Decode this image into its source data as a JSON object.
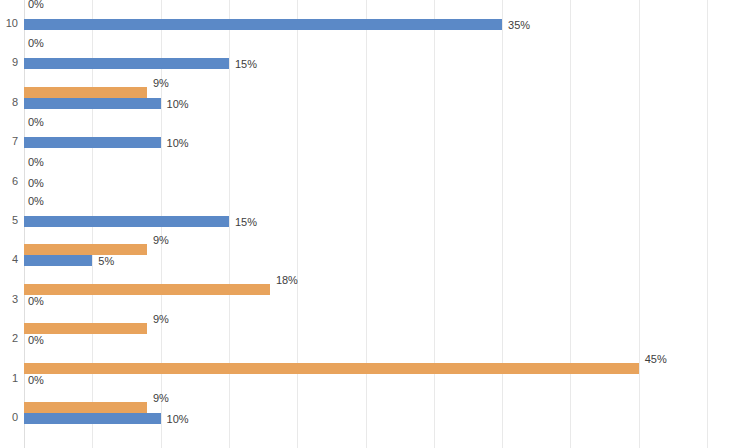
{
  "chart_data": {
    "type": "bar",
    "orientation": "horizontal",
    "title": "",
    "subtitle": "",
    "xlabel": "",
    "ylabel": "",
    "grid": true,
    "gridline_values": [
      0,
      5,
      10,
      15,
      20,
      25,
      30,
      35,
      40,
      45,
      50
    ],
    "xlim": [
      0,
      50
    ],
    "xtick_labels_visible": false,
    "categories": [
      "10",
      "9",
      "8",
      "7",
      "6",
      "5",
      "4",
      "3",
      "2",
      "1",
      "0"
    ],
    "category_order": "descending",
    "value_label_suffix": "%",
    "legend": {
      "position": "right",
      "clipped_by_image_edge": true,
      "entries": [
        {
          "name": "O",
          "color": "#e8a35c"
        },
        {
          "name": "A",
          "color": "#5b89c7"
        }
      ]
    },
    "series": [
      {
        "name": "O",
        "color": "#e8a35c",
        "values": [
          0,
          0,
          9,
          0,
          0,
          0,
          9,
          18,
          9,
          45,
          9
        ],
        "value_labels": [
          "0%",
          "0%",
          "9%",
          "0%",
          "0%",
          "0%",
          "9%",
          "18%",
          "9%",
          "45%",
          "9%"
        ]
      },
      {
        "name": "A",
        "color": "#5b89c7",
        "values": [
          35,
          15,
          10,
          10,
          0,
          15,
          5,
          0,
          0,
          0,
          10
        ],
        "value_labels": [
          "35%",
          "15%",
          "10%",
          "10%",
          "0%",
          "15%",
          "5%",
          "0%",
          "0%",
          "0%",
          "10%"
        ]
      }
    ],
    "rows": [
      {
        "category": "10",
        "a_value": 0,
        "a_label": "0%",
        "b_value": 35,
        "b_label": "35%"
      },
      {
        "category": "9",
        "a_value": 0,
        "a_label": "0%",
        "b_value": 15,
        "b_label": "15%"
      },
      {
        "category": "8",
        "a_value": 9,
        "a_label": "9%",
        "b_value": 10,
        "b_label": "10%"
      },
      {
        "category": "7",
        "a_value": 0,
        "a_label": "0%",
        "b_value": 10,
        "b_label": "10%"
      },
      {
        "category": "6",
        "a_value": 0,
        "a_label": "0%",
        "b_value": 0,
        "b_label": "0%"
      },
      {
        "category": "5",
        "a_value": 0,
        "a_label": "0%",
        "b_value": 15,
        "b_label": "15%"
      },
      {
        "category": "4",
        "a_value": 9,
        "a_label": "9%",
        "b_value": 5,
        "b_label": "5%"
      },
      {
        "category": "3",
        "a_value": 18,
        "a_label": "18%",
        "b_value": 0,
        "b_label": "0%"
      },
      {
        "category": "2",
        "a_value": 9,
        "a_label": "9%",
        "b_value": 0,
        "b_label": "0%"
      },
      {
        "category": "1",
        "a_value": 45,
        "a_label": "45%",
        "b_value": 0,
        "b_label": "0%"
      },
      {
        "category": "0",
        "a_value": 9,
        "a_label": "9%",
        "b_value": 10,
        "b_label": "10%"
      }
    ]
  }
}
